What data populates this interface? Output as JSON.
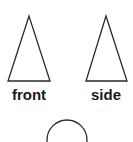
{
  "diagram": {
    "views": [
      {
        "id": "front",
        "label": "front",
        "shape": "triangle"
      },
      {
        "id": "side",
        "label": "side",
        "shape": "triangle"
      },
      {
        "id": "top",
        "label": "",
        "shape": "circle"
      }
    ]
  }
}
